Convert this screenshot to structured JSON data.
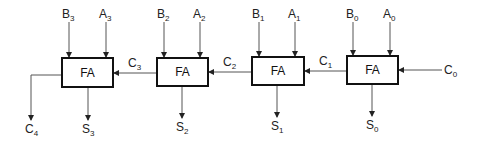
{
  "diagram": {
    "type": "4-bit ripple carry adder",
    "blocks": [
      {
        "label": "FA",
        "x": 62,
        "y": 58,
        "w": 51,
        "h": 29,
        "inputs": [
          {
            "name": "B",
            "sub": "3",
            "x": 69
          },
          {
            "name": "A",
            "sub": "3",
            "x": 106
          }
        ],
        "sum": {
          "name": "S",
          "sub": "3",
          "x": 88
        },
        "carry_in": {
          "name": "C",
          "sub": "3"
        }
      },
      {
        "label": "FA",
        "x": 157,
        "y": 58,
        "w": 51,
        "h": 28,
        "inputs": [
          {
            "name": "B",
            "sub": "2",
            "x": 164
          },
          {
            "name": "A",
            "sub": "2",
            "x": 200
          }
        ],
        "sum": {
          "name": "S",
          "sub": "2",
          "x": 182
        },
        "carry_in": {
          "name": "C",
          "sub": "2"
        }
      },
      {
        "label": "FA",
        "x": 252,
        "y": 57,
        "w": 52,
        "h": 28,
        "inputs": [
          {
            "name": "B",
            "sub": "1",
            "x": 259
          },
          {
            "name": "A",
            "sub": "1",
            "x": 295
          }
        ],
        "sum": {
          "name": "S",
          "sub": "1",
          "x": 277
        },
        "carry_in": {
          "name": "C",
          "sub": "1"
        }
      },
      {
        "label": "FA",
        "x": 347,
        "y": 56,
        "w": 51,
        "h": 28,
        "inputs": [
          {
            "name": "B",
            "sub": "0",
            "x": 353
          },
          {
            "name": "A",
            "sub": "0",
            "x": 390
          }
        ],
        "sum": {
          "name": "S",
          "sub": "0",
          "x": 372
        },
        "carry_in": {
          "name": "C",
          "sub": "0"
        }
      }
    ],
    "carry_out": {
      "name": "C",
      "sub": "4"
    },
    "labels": {
      "b3": "B",
      "b3s": "3",
      "a3": "A",
      "a3s": "3",
      "b2": "B",
      "b2s": "2",
      "a2": "A",
      "a2s": "2",
      "b1": "B",
      "b1s": "1",
      "a1": "A",
      "a1s": "1",
      "b0": "B",
      "b0s": "0",
      "a0": "A",
      "a0s": "0",
      "s3": "S",
      "s3s": "3",
      "s2": "S",
      "s2s": "2",
      "s1": "S",
      "s1s": "1",
      "s0": "S",
      "s0s": "0",
      "c4": "C",
      "c4s": "4",
      "c3": "C",
      "c3s": "3",
      "c2": "C",
      "c2s": "2",
      "c1": "C",
      "c1s": "1",
      "c0": "C",
      "c0s": "0",
      "fa": "FA"
    }
  }
}
